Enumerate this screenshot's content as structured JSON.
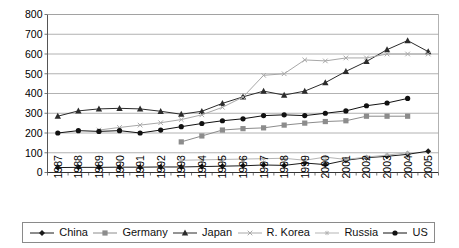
{
  "chart_data": {
    "type": "line",
    "title": "",
    "xlabel": "",
    "ylabel": "",
    "ylim": [
      0,
      800
    ],
    "ytick_step": 100,
    "grid": true,
    "legend_position": "bottom",
    "categories": [
      "1987",
      "1988",
      "1989",
      "1990",
      "1991",
      "1992",
      "1993",
      "1994",
      "1995",
      "1996",
      "1997",
      "1998",
      "1999",
      "2000",
      "2001",
      "2002",
      "2003",
      "2004",
      "2005"
    ],
    "yticks": [
      "800",
      "700",
      "600",
      "500",
      "400",
      "300",
      "200",
      "100",
      "0"
    ],
    "series": [
      {
        "name": "China",
        "marker": "diamond",
        "color": "#1a1a1a",
        "values": [
          25,
          26,
          26,
          27,
          27,
          28,
          28,
          30,
          32,
          34,
          38,
          36,
          48,
          40,
          62,
          75,
          82,
          92,
          108
        ]
      },
      {
        "name": "Germany",
        "marker": "square",
        "color": "#8c8c8c",
        "values": [
          null,
          null,
          null,
          null,
          null,
          null,
          155,
          185,
          215,
          222,
          226,
          240,
          250,
          258,
          262,
          285,
          285,
          285,
          null
        ]
      },
      {
        "name": "Japan",
        "marker": "triangle",
        "color": "#2b2b2b",
        "values": [
          285,
          312,
          322,
          325,
          322,
          310,
          295,
          310,
          350,
          383,
          412,
          392,
          412,
          455,
          512,
          562,
          622,
          668,
          612
        ]
      },
      {
        "name": "R. Korea",
        "marker": "x",
        "color": "#a8a8a8",
        "values": [
          null,
          null,
          215,
          228,
          240,
          252,
          268,
          292,
          330,
          382,
          492,
          500,
          570,
          565,
          580,
          580,
          600,
          600,
          600
        ]
      },
      {
        "name": "Russia",
        "marker": "asterisk",
        "color": "#b5b5b5",
        "values": [
          null,
          null,
          null,
          null,
          null,
          null,
          62,
          64,
          66,
          68,
          70,
          72,
          62,
          78,
          66,
          78,
          88,
          100,
          null
        ]
      },
      {
        "name": "US",
        "marker": "circle",
        "color": "#111111",
        "values": [
          200,
          212,
          208,
          212,
          200,
          215,
          232,
          248,
          262,
          272,
          288,
          292,
          288,
          300,
          312,
          338,
          352,
          375,
          null
        ]
      }
    ]
  },
  "legend": {
    "items": [
      {
        "label": "China",
        "marker": "diamond",
        "color": "#1a1a1a"
      },
      {
        "label": "Germany",
        "marker": "square",
        "color": "#8c8c8c"
      },
      {
        "label": "Japan",
        "marker": "triangle",
        "color": "#2b2b2b"
      },
      {
        "label": "R. Korea",
        "marker": "x",
        "color": "#a8a8a8"
      },
      {
        "label": "Russia",
        "marker": "asterisk",
        "color": "#b5b5b5"
      },
      {
        "label": "US",
        "marker": "circle",
        "color": "#111111"
      }
    ]
  }
}
